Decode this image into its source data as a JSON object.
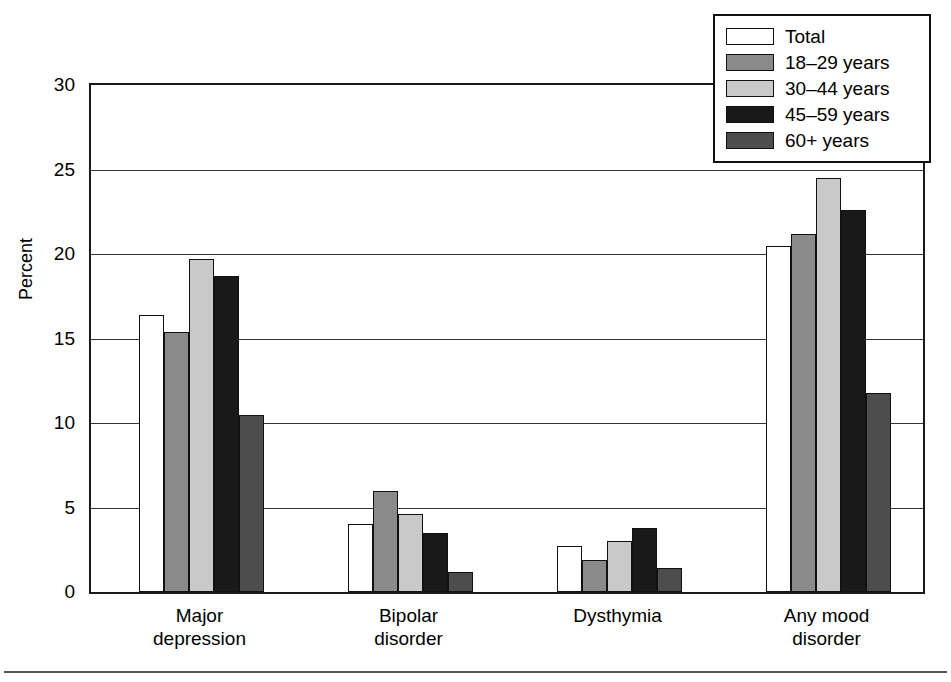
{
  "chart_data": {
    "type": "bar",
    "title": "",
    "xlabel": "",
    "ylabel": "Percent",
    "ylim": [
      0,
      30
    ],
    "yticks": [
      0,
      5,
      10,
      15,
      20,
      25,
      30
    ],
    "ytick_labels": [
      "0",
      "5",
      "10",
      "15",
      "20",
      "25",
      "30"
    ],
    "grid": true,
    "legend_position": "top-right",
    "categories": [
      "Major depression",
      "Bipolar disorder",
      "Dysthymia",
      "Any mood disorder"
    ],
    "category_lines": [
      [
        "Major",
        "depression"
      ],
      [
        "Bipolar",
        "disorder"
      ],
      [
        "Dysthymia",
        ""
      ],
      [
        "Any mood",
        "disorder"
      ]
    ],
    "series": [
      {
        "name": "Total",
        "color": "#ffffff",
        "values": [
          16.4,
          4.0,
          2.7,
          20.5
        ]
      },
      {
        "name": "18–29 years",
        "color": "#8a8a8a",
        "values": [
          15.4,
          6.0,
          1.9,
          21.2
        ]
      },
      {
        "name": "30–44 years",
        "color": "#c9c9c9",
        "values": [
          19.7,
          4.6,
          3.0,
          24.5
        ]
      },
      {
        "name": "45–59 years",
        "color": "#191919",
        "values": [
          18.7,
          3.5,
          3.8,
          22.6
        ]
      },
      {
        "name": "60+ years",
        "color": "#4d4d4d",
        "values": [
          10.5,
          1.2,
          1.4,
          11.8
        ]
      }
    ]
  },
  "axis": {
    "y_title": "Percent",
    "y_labels": [
      "30",
      "25",
      "20",
      "15",
      "10",
      "5",
      "0"
    ]
  },
  "legend": {
    "items": [
      {
        "label": "Total",
        "swatch": "legend-swatch-total"
      },
      {
        "label": "18–29 years",
        "swatch": "legend-swatch-18-29"
      },
      {
        "label": "30–44 years",
        "swatch": "legend-swatch-30-44"
      },
      {
        "label": "45–59 years",
        "swatch": "legend-swatch-45-59"
      },
      {
        "label": "60+ years",
        "swatch": "legend-swatch-60-plus"
      }
    ]
  },
  "categories": {
    "c0_line1": "Major",
    "c0_line2": "depression",
    "c1_line1": "Bipolar",
    "c1_line2": "disorder",
    "c2_line1": "Dysthymia",
    "c2_line2": "",
    "c3_line1": "Any mood",
    "c3_line2": "disorder"
  }
}
